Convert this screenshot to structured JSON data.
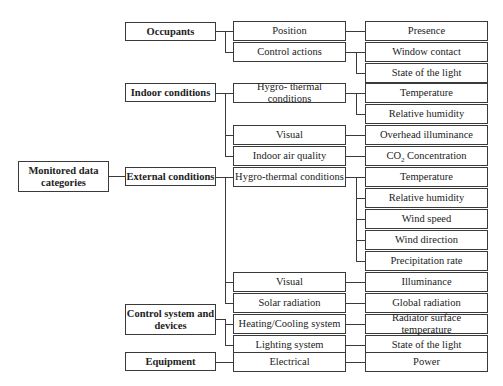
{
  "diagram": {
    "root": {
      "label": "Monitored data categories"
    },
    "categories": [
      {
        "label": "Occupants",
        "subcategories": [
          {
            "label": "Position",
            "items": [
              "Presence"
            ]
          },
          {
            "label": "Control actions",
            "items": [
              "Window contact",
              "State of the light"
            ]
          }
        ]
      },
      {
        "label": "Indoor conditions",
        "subcategories": [
          {
            "label": "Hygro- thermal conditions",
            "items": [
              "Temperature",
              "Relative humidity"
            ]
          },
          {
            "label": "Visual",
            "items": [
              "Overhead illuminance"
            ]
          },
          {
            "label": "Indoor air quality",
            "items": [
              "CO2 Concentration"
            ]
          }
        ]
      },
      {
        "label": "External conditions",
        "subcategories": [
          {
            "label": "Hygro-thermal conditions",
            "items": [
              "Temperature",
              "Relative humidity",
              "Wind speed",
              "Wind direction",
              "Precipitation rate"
            ]
          },
          {
            "label": "Visual",
            "items": [
              "Illuminance"
            ]
          },
          {
            "label": "Solar radiation",
            "items": [
              "Global radiation"
            ]
          }
        ]
      },
      {
        "label": "Control system and devices",
        "subcategories": [
          {
            "label": "Heating/Cooling system",
            "items": [
              "Radiator surface temperature"
            ]
          },
          {
            "label": "Lighting system",
            "items": [
              "State of the light"
            ]
          }
        ]
      },
      {
        "label": "Equipment",
        "subcategories": [
          {
            "label": "Electrical",
            "items": [
              "Power"
            ]
          }
        ]
      }
    ],
    "co2": {
      "prefix": "CO",
      "subscript": "2",
      "suffix": " Concentration"
    }
  }
}
